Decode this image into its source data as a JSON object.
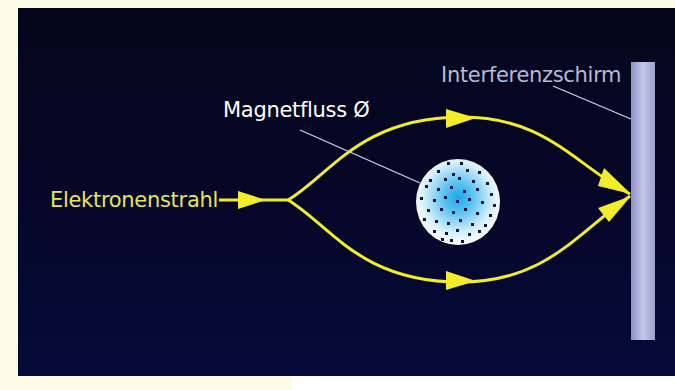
{
  "diagram": {
    "type": "Aharonov-Bohm experiment schematic",
    "labels": {
      "beam": "Elektronenstrahl",
      "flux": "Magnetfluss Ø",
      "screen": "Interferenzschirm"
    },
    "colors": {
      "background": "#050626",
      "beam": "#f2ec2a",
      "screen": "#a9add6",
      "flux_center": "#2fb4f0",
      "flux_edge": "#ffffff",
      "leader_lines": "#d0d4ec",
      "outer_margin_left": "#fbfbe8",
      "outer_margin_right": "#ffffff"
    },
    "elements": [
      {
        "id": "incoming-beam",
        "kind": "arrow",
        "from": "Elektronenstrahl",
        "to": "split-point"
      },
      {
        "id": "upper-path",
        "kind": "curved-arrow",
        "from": "split-point",
        "to": "screen",
        "passes": "above flux"
      },
      {
        "id": "lower-path",
        "kind": "curved-arrow",
        "from": "split-point",
        "to": "screen",
        "passes": "below flux"
      },
      {
        "id": "flux-tube",
        "kind": "disk",
        "label": "Magnetfluss Ø"
      },
      {
        "id": "screen",
        "kind": "bar",
        "label": "Interferenzschirm"
      }
    ]
  }
}
